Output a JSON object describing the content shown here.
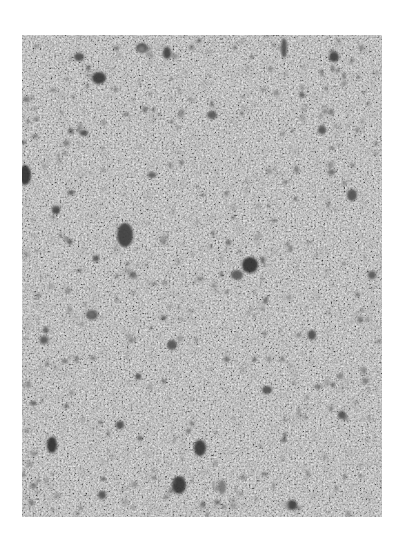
{
  "image": {
    "description": "Grayscale close-up photograph of a porous granular surface with scattered dark pores and voids",
    "frame": {
      "x": 22,
      "y": 35,
      "width": 360,
      "height": 482
    },
    "background_color": "#ffffff",
    "texture": {
      "base_color": "#b9b9b9",
      "light_color": "#e6e6e6",
      "mid_color": "#9a9a9a",
      "dark_color": "#3c3c3c"
    },
    "pores": [
      {
        "x": 77,
        "y": 43,
        "rx": 7,
        "ry": 6,
        "shade": "#353535"
      },
      {
        "x": 57,
        "y": 22,
        "rx": 5,
        "ry": 4,
        "shade": "#4a4a4a"
      },
      {
        "x": 120,
        "y": 13,
        "rx": 6,
        "ry": 5,
        "shade": "#505050"
      },
      {
        "x": 145,
        "y": 18,
        "rx": 4,
        "ry": 6,
        "shade": "#3e3e3e"
      },
      {
        "x": 262,
        "y": 13,
        "rx": 3,
        "ry": 10,
        "shade": "#4c4c4c"
      },
      {
        "x": 312,
        "y": 22,
        "rx": 5,
        "ry": 5,
        "shade": "#3a3a3a"
      },
      {
        "x": 3,
        "y": 140,
        "rx": 6,
        "ry": 10,
        "shade": "#2e2e2e"
      },
      {
        "x": 34,
        "y": 175,
        "rx": 4,
        "ry": 4,
        "shade": "#3c3c3c"
      },
      {
        "x": 103,
        "y": 200,
        "rx": 8,
        "ry": 12,
        "shade": "#3a3a3a"
      },
      {
        "x": 228,
        "y": 230,
        "rx": 8,
        "ry": 8,
        "shade": "#2f2f2f"
      },
      {
        "x": 215,
        "y": 240,
        "rx": 6,
        "ry": 5,
        "shade": "#555555"
      },
      {
        "x": 62,
        "y": 98,
        "rx": 4,
        "ry": 3,
        "shade": "#4a4a4a"
      },
      {
        "x": 190,
        "y": 80,
        "rx": 5,
        "ry": 4,
        "shade": "#555555"
      },
      {
        "x": 300,
        "y": 95,
        "rx": 4,
        "ry": 4,
        "shade": "#4f4f4f"
      },
      {
        "x": 330,
        "y": 160,
        "rx": 5,
        "ry": 6,
        "shade": "#505050"
      },
      {
        "x": 70,
        "y": 280,
        "rx": 6,
        "ry": 5,
        "shade": "#5a5a5a"
      },
      {
        "x": 150,
        "y": 310,
        "rx": 5,
        "ry": 5,
        "shade": "#525252"
      },
      {
        "x": 290,
        "y": 300,
        "rx": 4,
        "ry": 5,
        "shade": "#4a4a4a"
      },
      {
        "x": 22,
        "y": 305,
        "rx": 4,
        "ry": 4,
        "shade": "#555555"
      },
      {
        "x": 245,
        "y": 355,
        "rx": 5,
        "ry": 4,
        "shade": "#4e4e4e"
      },
      {
        "x": 320,
        "y": 380,
        "rx": 4,
        "ry": 4,
        "shade": "#4c4c4c"
      },
      {
        "x": 30,
        "y": 410,
        "rx": 5,
        "ry": 8,
        "shade": "#2f2f2f"
      },
      {
        "x": 98,
        "y": 390,
        "rx": 4,
        "ry": 4,
        "shade": "#4a4a4a"
      },
      {
        "x": 178,
        "y": 413,
        "rx": 6,
        "ry": 8,
        "shade": "#353535"
      },
      {
        "x": 157,
        "y": 450,
        "rx": 7,
        "ry": 9,
        "shade": "#303030"
      },
      {
        "x": 200,
        "y": 452,
        "rx": 4,
        "ry": 7,
        "shade": "#777777"
      },
      {
        "x": 270,
        "y": 470,
        "rx": 5,
        "ry": 5,
        "shade": "#3a3a3a"
      },
      {
        "x": 80,
        "y": 460,
        "rx": 4,
        "ry": 4,
        "shade": "#4f4f4f"
      },
      {
        "x": 350,
        "y": 240,
        "rx": 4,
        "ry": 4,
        "shade": "#555555"
      },
      {
        "x": 130,
        "y": 140,
        "rx": 4,
        "ry": 3,
        "shade": "#5b5b5b"
      }
    ]
  },
  "footer": {
    "text": "",
    "legible": false
  }
}
